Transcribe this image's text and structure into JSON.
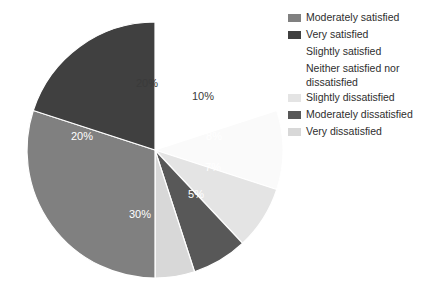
{
  "chart_data": {
    "type": "pie",
    "title": "",
    "subtitle": "",
    "xlabel": "",
    "ylabel": "",
    "grid": false,
    "legend_position": "right",
    "center": [
      155,
      150
    ],
    "radius": 128,
    "start_angle_deg": -90,
    "categories": [
      "Moderately satisfied",
      "Very satisfied",
      "Slightly satisfied",
      "Neither satisfied nor dissatisfied",
      "Slightly dissatisfied",
      "Moderately dissatisfied",
      "Very dissatisfied"
    ],
    "values": [
      30,
      20,
      20,
      10,
      8,
      7,
      5
    ],
    "data_labels": [
      "30%",
      "20%",
      "20%",
      "10%",
      "8%",
      "7%",
      "5%"
    ],
    "colors": [
      "#808080",
      "#404040",
      "#ffffff",
      "#fcfcfc",
      "#e2e2e2",
      "#585858",
      "#d8d8d8"
    ],
    "slices": [
      {
        "label": "Slightly satisfied",
        "value": 20,
        "data_label": "20%",
        "color": "#ffffff",
        "label_color": "light",
        "label_pos": [
          147,
          84
        ]
      },
      {
        "label": "Neither satisfied nor dissatisfied",
        "value": 10,
        "data_label": "10%",
        "color": "#fafafa",
        "label_color": "light",
        "label_pos": [
          203,
          97
        ]
      },
      {
        "label": "Slightly dissatisfied",
        "value": 8,
        "data_label": "8%",
        "color": "#e4e4e4",
        "label_color": "faint",
        "label_pos": [
          214,
          137
        ]
      },
      {
        "label": "Moderately dissatisfied",
        "value": 7,
        "data_label": "7%",
        "color": "#585858",
        "label_color": "dark",
        "label_pos": [
          213,
          168
        ]
      },
      {
        "label": "Very dissatisfied",
        "value": 5,
        "data_label": "5%",
        "color": "#d8d8d8",
        "label_color": "faint",
        "label_pos": [
          196,
          195
        ]
      },
      {
        "label": "Moderately satisfied",
        "value": 30,
        "data_label": "30%",
        "color": "#808080",
        "label_color": "dark",
        "label_pos": [
          140,
          215
        ]
      },
      {
        "label": "Very satisfied",
        "value": 20,
        "data_label": "20%",
        "color": "#404040",
        "label_color": "dark",
        "label_pos": [
          82,
          137
        ]
      }
    ]
  },
  "legend": {
    "items": [
      {
        "label": "Moderately satisfied",
        "color": "#808080",
        "swatch_visible": true
      },
      {
        "label": "Very satisfied",
        "color": "#404040",
        "swatch_visible": true
      },
      {
        "label": "Slightly satisfied",
        "color": "#ffffff",
        "swatch_visible": false
      },
      {
        "label": "Neither satisfied nor\ndissatisfied",
        "color": "#fcfcfc",
        "swatch_visible": false
      },
      {
        "label": "Slightly dissatisfied",
        "color": "#e4e4e4",
        "swatch_visible": true
      },
      {
        "label": "Moderately dissatisfied",
        "color": "#585858",
        "swatch_visible": true
      },
      {
        "label": "Very dissatisfied",
        "color": "#d8d8d8",
        "swatch_visible": true
      }
    ]
  }
}
